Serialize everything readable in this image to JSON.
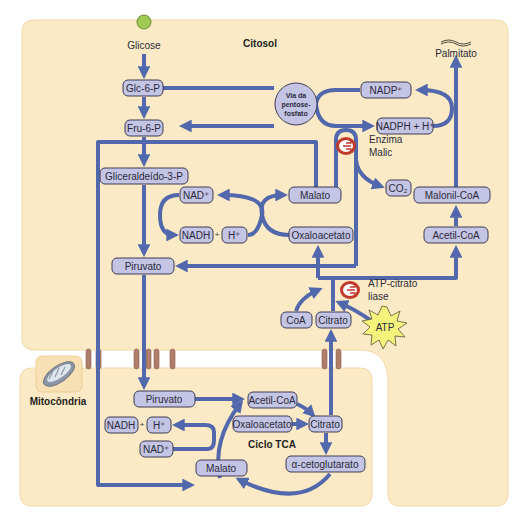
{
  "compartments": {
    "cytosol": {
      "label": "Citosol",
      "fill": "#fbeac5",
      "border": "#f2d9a6"
    },
    "mitochondria": {
      "label": "Mitocôndria",
      "fill": "#fbeac5"
    }
  },
  "colors": {
    "arrow": "#5268ad",
    "box_fill": "#c4c4e4",
    "box_border": "#3d3d55",
    "enzyme": "#c0392b",
    "transporter": "#b07f6a",
    "atp": "#f5f37a",
    "glucose": "#9ecb54"
  },
  "cytosol": {
    "glicose": "Glicose",
    "glc6p": "Glc-6-P",
    "fru6p": "Fru-6-P",
    "gliceraldeido": "Gliceraldeído-3-P",
    "nad": "NAD⁺",
    "nadh": "NADH",
    "plus": "+",
    "h": "H⁺",
    "malato": "Malato",
    "oxaloacetato": "Oxaloacetato",
    "piruvato": "Piruvato",
    "coa": "CoA",
    "citrato": "Citrato",
    "pentose": [
      "Via da",
      "pentose-",
      "fosfato"
    ],
    "nadp": "NADP⁺",
    "nadph": "NADPH + H⁺",
    "enzima_malic": [
      "Enzima",
      "Malic"
    ],
    "co2": "CO₂",
    "palmitato": "Palmitato",
    "malonil": "Malonil-CoA",
    "acetil": "Acetil-CoA",
    "atp_citrato_liase": [
      "ATP-citrato",
      "liase"
    ],
    "atp": "ATP"
  },
  "mitochondria": {
    "piruvato": "Piruvato",
    "nadh": "NADH",
    "plus": "+",
    "h": "H⁺",
    "nad": "NAD⁺",
    "malato": "Malato",
    "acetil": "Acetil-CoA",
    "oxaloacetato": "Oxaloacetato",
    "citrato": "Citrato",
    "cetoglutarato": "α-cetoglutarato",
    "ciclo": "Ciclo TCA"
  }
}
